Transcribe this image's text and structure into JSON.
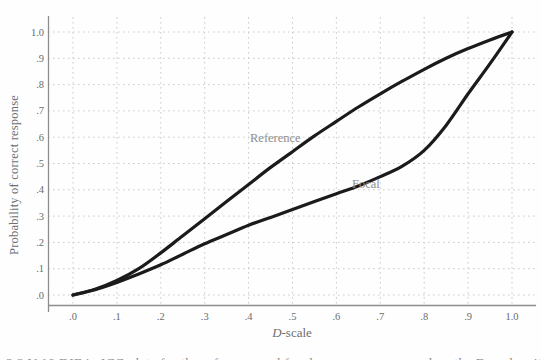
{
  "chart_data": {
    "type": "line",
    "title": "",
    "xlabel": "D-scale",
    "xlabel_italic_part": "D",
    "xlabel_regular_part": "-scale",
    "ylabel": "Probability of correct response",
    "xlim": [
      0,
      1
    ],
    "ylim": [
      0,
      1
    ],
    "grid": "dotted gridlines at every 0.1 on both axes",
    "legend_position": "inline labels next to curves",
    "x_ticks": [
      {
        "v": 0.0,
        "label": ".0"
      },
      {
        "v": 0.1,
        "label": ".1"
      },
      {
        "v": 0.2,
        "label": ".2"
      },
      {
        "v": 0.3,
        "label": ".3"
      },
      {
        "v": 0.4,
        "label": ".4"
      },
      {
        "v": 0.5,
        "label": ".5"
      },
      {
        "v": 0.6,
        "label": ".6"
      },
      {
        "v": 0.7,
        "label": ".7"
      },
      {
        "v": 0.8,
        "label": ".8"
      },
      {
        "v": 0.9,
        "label": ".9"
      },
      {
        "v": 1.0,
        "label": "1.0"
      }
    ],
    "y_ticks": [
      {
        "v": 0.0,
        "label": ".0"
      },
      {
        "v": 0.1,
        "label": ".1"
      },
      {
        "v": 0.2,
        "label": ".2"
      },
      {
        "v": 0.3,
        "label": ".3"
      },
      {
        "v": 0.4,
        "label": ".4"
      },
      {
        "v": 0.5,
        "label": ".5"
      },
      {
        "v": 0.6,
        "label": ".6"
      },
      {
        "v": 0.7,
        "label": ".7"
      },
      {
        "v": 0.8,
        "label": ".8"
      },
      {
        "v": 0.9,
        "label": ".9"
      },
      {
        "v": 1.0,
        "label": "1.0"
      }
    ],
    "x": [
      0,
      0.05,
      0.1,
      0.15,
      0.2,
      0.25,
      0.3,
      0.35,
      0.4,
      0.45,
      0.5,
      0.55,
      0.6,
      0.65,
      0.7,
      0.75,
      0.8,
      0.85,
      0.9,
      0.95,
      1.0
    ],
    "series": [
      {
        "name": "Reference",
        "values": [
          0,
          0.022,
          0.055,
          0.1,
          0.16,
          0.225,
          0.29,
          0.355,
          0.42,
          0.485,
          0.545,
          0.605,
          0.66,
          0.715,
          0.765,
          0.813,
          0.858,
          0.9,
          0.937,
          0.97,
          1.0
        ],
        "label_anchor": {
          "x": 0.465,
          "y": 0.59
        }
      },
      {
        "name": "Focal",
        "values": [
          0,
          0.02,
          0.048,
          0.08,
          0.115,
          0.155,
          0.195,
          0.23,
          0.265,
          0.295,
          0.325,
          0.355,
          0.385,
          0.415,
          0.45,
          0.49,
          0.55,
          0.645,
          0.765,
          0.88,
          1.0
        ],
        "label_anchor": {
          "x": 0.672,
          "y": 0.42
        }
      }
    ]
  },
  "colors": {
    "curve": "#1b1b1b",
    "axis": "#8d8d8d",
    "grid": "#cbcbcb",
    "tick_text": "#6b6b6b",
    "axis_title_text": "#6e6e6e",
    "curve_label_text": "#8f8f8f",
    "background": "#fefefe"
  },
  "clipped_caption": "2.3 V:10   DIF in ICC plots for the reference and focal groups as compared on the D-scale with DIF"
}
